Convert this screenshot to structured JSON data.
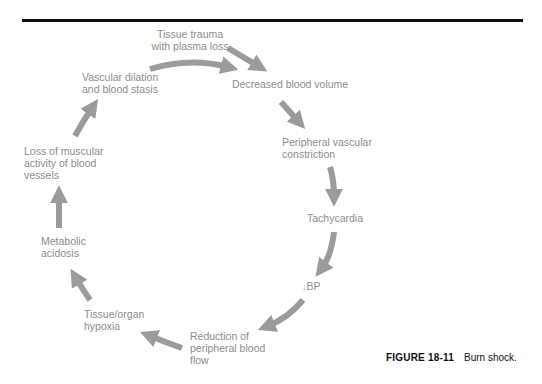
{
  "diagram": {
    "arrow_color": "#9b9b9b",
    "text_color": "#8c8c8c",
    "nodes": [
      {
        "id": "tissue-trauma",
        "lines": [
          "Tissue trauma",
          "with plasma loss"
        ]
      },
      {
        "id": "decreased-blood-volume",
        "lines": [
          "Decreased blood volume"
        ]
      },
      {
        "id": "peripheral-vascular-constriction",
        "lines": [
          "Peripheral vascular",
          "constriction"
        ]
      },
      {
        "id": "tachycardia",
        "lines": [
          "Tachycardia"
        ]
      },
      {
        "id": "decreased-bp",
        "symbol": "↓",
        "lines": [
          "BP"
        ]
      },
      {
        "id": "reduction-peripheral-flow",
        "lines": [
          "Reduction of",
          "peripheral blood",
          "flow"
        ]
      },
      {
        "id": "tissue-organ-hypoxia",
        "lines": [
          "Tissue/organ",
          "hypoxia"
        ]
      },
      {
        "id": "metabolic-acidosis",
        "lines": [
          "Metabolic",
          "acidosis"
        ]
      },
      {
        "id": "loss-muscular-activity",
        "lines": [
          "Loss of muscular",
          "activity of blood",
          "vessels"
        ]
      },
      {
        "id": "vascular-dilation",
        "lines": [
          "Vascular dilation",
          "and blood stasis"
        ]
      }
    ]
  },
  "caption": {
    "figure_label": "FIGURE 18-11",
    "text": "Burn shock."
  }
}
